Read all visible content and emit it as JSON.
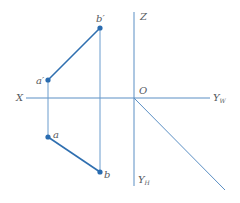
{
  "diagram": {
    "type": "orthographic-projection",
    "colors": {
      "axis": "#5b8fc4",
      "segment": "#2f6fb0",
      "point": "#2a6cb0",
      "label": "#555a60",
      "background": "#ffffff"
    },
    "axes": {
      "x_label": "X",
      "z_label": "Z",
      "origin_label": "O",
      "yw_label": "Y",
      "yw_sub": "W",
      "yh_label": "Y",
      "yh_sub": "H"
    },
    "points": [
      {
        "id": "b_prime",
        "label": "b′",
        "x": 100,
        "y": 28
      },
      {
        "id": "a_prime",
        "label": "a′",
        "x": 48,
        "y": 80
      },
      {
        "id": "a",
        "label": "a",
        "x": 48,
        "y": 137
      },
      {
        "id": "b",
        "label": "b",
        "x": 100,
        "y": 172
      }
    ],
    "segments": [
      {
        "from": "a_prime",
        "to": "b_prime",
        "view": "front"
      },
      {
        "from": "a",
        "to": "b",
        "view": "top"
      }
    ]
  }
}
